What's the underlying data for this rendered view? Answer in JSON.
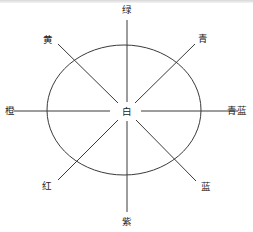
{
  "diagram": {
    "type": "color-wheel",
    "center_label": "白",
    "stroke_color": "#3a3a3a",
    "text_color": "#222222",
    "labels": {
      "top": "绿",
      "top_left": "黄",
      "top_right": "青",
      "left": "橙",
      "right": "青蓝",
      "bottom_left": "红",
      "bottom_right": "蓝",
      "bottom": "紫"
    }
  }
}
